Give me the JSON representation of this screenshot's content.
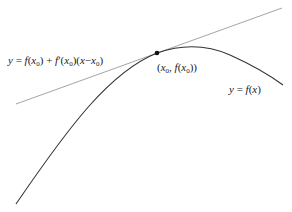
{
  "diagram": {
    "labels": {
      "tangent_equation": "y = f(x0) + f'(x0)(x − x0)",
      "point": "(x0, f(x0))",
      "curve": "y = f(x)"
    },
    "curve": {
      "name": "y = f(x)",
      "color": "#333333",
      "points": [
        [
          16,
          204
        ],
        [
          60,
          142
        ],
        [
          100,
          96
        ],
        [
          130,
          70
        ],
        [
          157,
          53
        ],
        [
          195,
          47
        ],
        [
          230,
          56
        ],
        [
          260,
          70
        ],
        [
          283,
          85
        ]
      ]
    },
    "tangent_line": {
      "color": "#999999",
      "start": [
        16,
        104
      ],
      "end": [
        282,
        8
      ]
    },
    "tangent_point": {
      "x": 157,
      "y": 53,
      "color": "#111111"
    }
  }
}
